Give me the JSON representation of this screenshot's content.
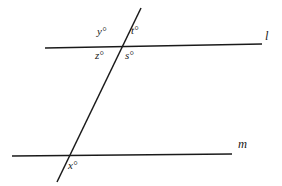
{
  "figure": {
    "type": "geometry-diagram",
    "width": 282,
    "height": 186,
    "background_color": "#ffffff",
    "stroke_color": "#1a1a1a",
    "stroke_width": 1.5
  },
  "lines": {
    "upper": {
      "name": "l",
      "label": "l",
      "x1": 45,
      "y1": 48,
      "x2": 262,
      "y2": 44
    },
    "lower": {
      "name": "m",
      "label": "m",
      "x1": 12,
      "y1": 156,
      "x2": 232,
      "y2": 154
    },
    "transversal": {
      "name": "transversal",
      "label": "",
      "x1": 141,
      "y1": 8,
      "x2": 57,
      "y2": 182
    }
  },
  "intersections": {
    "upper": {
      "x": 122,
      "y": 47
    },
    "lower": {
      "x": 68,
      "y": 156
    }
  },
  "angles": [
    {
      "id": "y",
      "label": "y°",
      "position": "upper-intersection-top-left"
    },
    {
      "id": "t",
      "label": "t°",
      "position": "upper-intersection-top-right"
    },
    {
      "id": "z",
      "label": "z°",
      "position": "upper-intersection-bottom-left"
    },
    {
      "id": "s",
      "label": "s°",
      "position": "upper-intersection-bottom-right"
    },
    {
      "id": "x",
      "label": "x°",
      "position": "lower-intersection-bottom-right"
    }
  ]
}
